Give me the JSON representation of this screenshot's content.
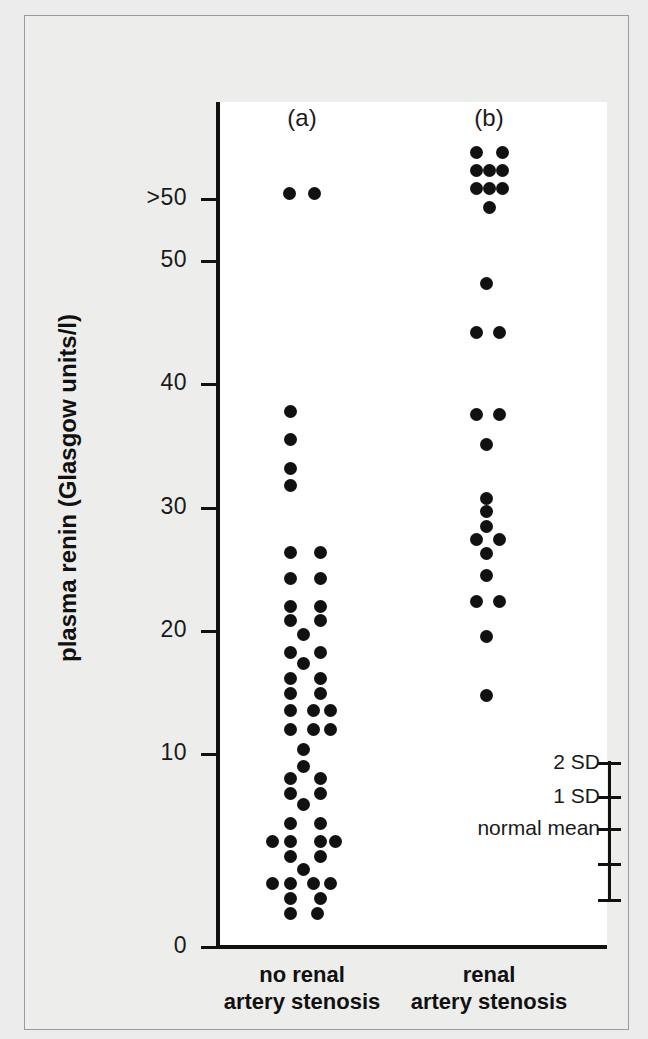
{
  "chart_data": {
    "type": "scatter",
    "title": "",
    "ylabel": "plasma renin (Glasgow units/l)",
    "xlabel": "",
    "ylim": [
      0,
      56
    ],
    "grid": false,
    "legend": "none",
    "y_ticks": [
      {
        "label": ">50",
        "value": 53.5
      },
      {
        "label": "50",
        "value": 50
      },
      {
        "label": "40",
        "value": 40
      },
      {
        "label": "30",
        "value": 30
      },
      {
        "label": "20",
        "value": 20
      },
      {
        "label": "10",
        "value": 10
      },
      {
        "label": "0",
        "value": 0
      }
    ],
    "panels": [
      {
        "letter": "(a)",
        "x_label_line1": "no renal",
        "x_label_line2": "artery stenosis",
        "center_x": 277,
        "values": [
          53.5,
          53.5,
          42.2,
          39.5,
          37.3,
          35.5,
          33.8,
          29.1,
          29.1,
          27.2,
          27.2,
          25.1,
          25.1,
          24.1,
          23.0,
          23.0,
          22.2,
          21.1,
          21.1,
          20.0,
          19.1,
          19.1,
          17.1,
          17.1,
          17.1,
          15.5,
          15.5,
          15.5,
          13.3,
          12.2,
          11.1,
          11.1,
          10.0,
          9.0,
          9.0,
          8.1,
          7.1,
          7.1,
          7.1,
          7.1,
          6.2,
          6.2,
          5.3,
          4.2,
          4.2,
          4.2,
          4.2,
          3.2,
          3.2,
          2.3,
          2.3
        ]
      },
      {
        "letter": "(b)",
        "x_label_line1": "renal",
        "x_label_line2": "artery stenosis",
        "center_x": 464,
        "values": [
          54.5,
          54.5,
          53.2,
          53.2,
          53.2,
          52.0,
          52.0,
          52.0,
          50.6,
          49.2,
          45.4,
          45.4,
          39.2,
          39.2,
          37.0,
          33.2,
          30.1,
          30.1,
          28.5,
          27.2,
          25.5,
          25.5,
          22.5,
          18.1
        ]
      }
    ],
    "reference_scale": {
      "labels": [
        {
          "text": "2 SD",
          "y": 747
        },
        {
          "text": "1 SD",
          "y": 781
        },
        {
          "text": "normal mean",
          "y": 813
        }
      ],
      "ticks": [
        747,
        781,
        813,
        848,
        884
      ]
    }
  },
  "chart": {
    "y_axis_title": "plasma renin (Glasgow units/l)",
    "panel_a_letter": "(a)",
    "panel_b_letter": "(b)",
    "xlabel_a_line1": "no renal",
    "xlabel_a_line2": "artery stenosis",
    "xlabel_b_line1": "renal",
    "xlabel_b_line2": "artery stenosis",
    "sd_label_2sd": "2 SD",
    "sd_label_1sd": "1 SD",
    "sd_label_mean": "normal mean",
    "ytick_0": ">50",
    "ytick_1": "50",
    "ytick_2": "40",
    "ytick_3": "30",
    "ytick_4": "20",
    "ytick_5": "10",
    "ytick_6": "0"
  },
  "colors": {
    "background": "#ececec",
    "plot_background": "#ffffff",
    "ink": "#111111",
    "frame_border": "#9a9a9a"
  },
  "dots": {
    "a": [
      [
        264,
        177
      ],
      [
        289,
        177
      ],
      [
        265,
        395
      ],
      [
        265,
        423
      ],
      [
        265,
        452
      ],
      [
        265,
        469
      ],
      [
        265,
        536
      ],
      [
        295,
        536
      ],
      [
        265,
        562
      ],
      [
        295,
        562
      ],
      [
        265,
        590
      ],
      [
        295,
        590
      ],
      [
        265,
        604
      ],
      [
        295,
        604
      ],
      [
        278,
        618
      ],
      [
        265,
        636
      ],
      [
        295,
        636
      ],
      [
        278,
        647
      ],
      [
        265,
        662
      ],
      [
        295,
        662
      ],
      [
        265,
        677
      ],
      [
        295,
        677
      ],
      [
        265,
        694
      ],
      [
        288,
        694
      ],
      [
        305,
        694
      ],
      [
        265,
        713
      ],
      [
        288,
        713
      ],
      [
        305,
        713
      ],
      [
        278,
        733
      ],
      [
        278,
        750
      ],
      [
        265,
        762
      ],
      [
        295,
        762
      ],
      [
        265,
        777
      ],
      [
        295,
        777
      ],
      [
        278,
        788
      ],
      [
        265,
        807
      ],
      [
        295,
        807
      ],
      [
        247,
        825
      ],
      [
        265,
        825
      ],
      [
        295,
        825
      ],
      [
        310,
        825
      ],
      [
        265,
        840
      ],
      [
        295,
        840
      ],
      [
        278,
        853
      ],
      [
        247,
        867
      ],
      [
        265,
        867
      ],
      [
        288,
        867
      ],
      [
        305,
        867
      ],
      [
        265,
        882
      ],
      [
        295,
        882
      ],
      [
        265,
        897
      ],
      [
        292,
        897
      ]
    ],
    "b": [
      [
        451,
        136
      ],
      [
        477,
        136
      ],
      [
        451,
        154
      ],
      [
        464,
        154
      ],
      [
        477,
        154
      ],
      [
        451,
        172
      ],
      [
        464,
        172
      ],
      [
        477,
        172
      ],
      [
        464,
        191
      ],
      [
        461,
        267
      ],
      [
        451,
        316
      ],
      [
        474,
        316
      ],
      [
        451,
        398
      ],
      [
        474,
        398
      ],
      [
        461,
        428
      ],
      [
        461,
        482
      ],
      [
        461,
        495
      ],
      [
        461,
        510
      ],
      [
        451,
        523
      ],
      [
        474,
        523
      ],
      [
        461,
        537
      ],
      [
        461,
        559
      ],
      [
        451,
        585
      ],
      [
        474,
        585
      ],
      [
        461,
        620
      ],
      [
        461,
        679
      ]
    ]
  }
}
